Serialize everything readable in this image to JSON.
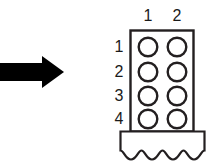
{
  "figure": {
    "background_color": "#ffffff",
    "line_color": "#231f20",
    "arrow_color": "#000000"
  },
  "pointer": {
    "icon": "right-arrow-icon",
    "direction": "right",
    "color": "#000000"
  },
  "connector": {
    "columns": 2,
    "rows": 4,
    "pin_count": 8,
    "pin_shape": "circle-outline",
    "body_outline_color": "#231f20",
    "base_break_line": "wavy"
  },
  "column_headers": [
    {
      "label": "1"
    },
    {
      "label": "2"
    }
  ],
  "row_headers": [
    {
      "label": "1"
    },
    {
      "label": "2"
    },
    {
      "label": "3"
    },
    {
      "label": "4"
    }
  ],
  "pins": [
    {
      "row": "1",
      "column": "1"
    },
    {
      "row": "1",
      "column": "2"
    },
    {
      "row": "2",
      "column": "1"
    },
    {
      "row": "2",
      "column": "2"
    },
    {
      "row": "3",
      "column": "1"
    },
    {
      "row": "3",
      "column": "2"
    },
    {
      "row": "4",
      "column": "1"
    },
    {
      "row": "4",
      "column": "2"
    }
  ]
}
